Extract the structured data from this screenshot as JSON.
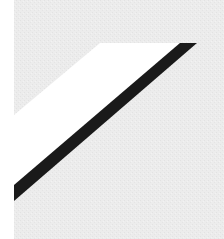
{
  "graphic": {
    "width": 224,
    "height": 239,
    "colors": {
      "background": "#ffffff",
      "panel": "#ececec",
      "panel_texture": "#e2e2e2",
      "highlight": "#ffffff",
      "stroke": "#1a1a1a"
    },
    "panel": {
      "x": 14,
      "y": 0,
      "width": 210,
      "height": 239
    },
    "highlight_shape": {
      "points": "100,43 180,43 14,185 14,115"
    },
    "diagonal_stroke": {
      "points": "180,43 197,43 14,201 14,185"
    }
  }
}
